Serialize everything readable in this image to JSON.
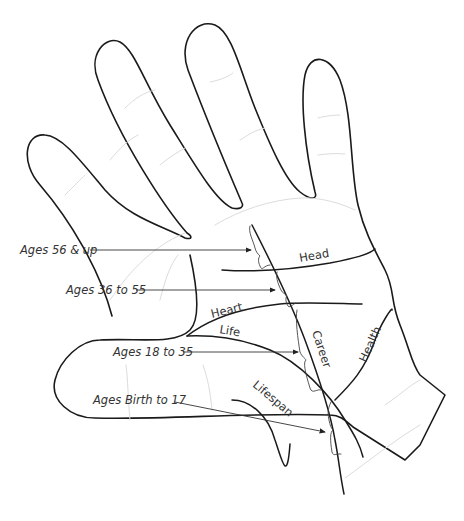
{
  "diagram": {
    "line_labels": {
      "head": "Head",
      "heart": "Heart",
      "life": "Life",
      "career": "Career",
      "health": "Health",
      "lifespan": "Lifespan"
    },
    "age_labels": [
      {
        "label": "Ages 56 & up"
      },
      {
        "label": "Ages 36 to 55"
      },
      {
        "label": "Ages 18 to 35"
      },
      {
        "label": "Ages Birth to 17"
      }
    ],
    "colors": {
      "outline": "#1a1a1a",
      "crease": "#dcdcdc",
      "text": "#333333",
      "background": "#ffffff"
    }
  }
}
